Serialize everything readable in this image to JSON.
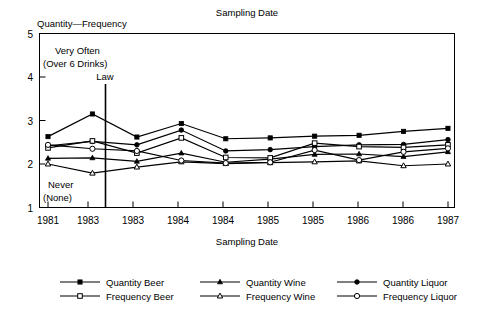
{
  "chart_data": {
    "type": "line",
    "title": "Sampling Date",
    "ylabel": "Quantity—Frequency",
    "xlabel": "Sampling Date",
    "categories": [
      "1981",
      "1983",
      "1983",
      "1984",
      "1984",
      "1985",
      "1985",
      "1986",
      "1986",
      "1987"
    ],
    "ylim": [
      1,
      5
    ],
    "yticks": [
      1,
      2,
      3,
      4,
      5
    ],
    "grid": false,
    "legend_position": "below",
    "annotations": [
      {
        "text": "Very Often",
        "note": "upper-left scale anchor line 1"
      },
      {
        "text": "(Over 6 Drinks)",
        "note": "upper-left scale anchor line 2"
      },
      {
        "text": "Never",
        "note": "lower-left scale anchor line 1"
      },
      {
        "text": "(None)",
        "note": "lower-left scale anchor line 2"
      },
      {
        "text": "Law",
        "note": "vertical reference line between 2nd and 3rd sampling date"
      }
    ],
    "series": [
      {
        "name": "Quantity Beer",
        "marker": "filled-square",
        "values": [
          2.63,
          3.15,
          2.62,
          2.93,
          2.58,
          2.6,
          2.64,
          2.66,
          2.75,
          2.82
        ]
      },
      {
        "name": "Quantity Wine",
        "marker": "filled-triangle",
        "values": [
          2.13,
          2.14,
          2.06,
          2.25,
          2.04,
          2.11,
          2.22,
          2.23,
          2.17,
          2.28
        ]
      },
      {
        "name": "Quantity Liquor",
        "marker": "filled-circle",
        "values": [
          2.42,
          2.52,
          2.44,
          2.78,
          2.3,
          2.33,
          2.4,
          2.44,
          2.45,
          2.56
        ]
      },
      {
        "name": "Frequency Beer",
        "marker": "open-square",
        "values": [
          2.37,
          2.53,
          2.25,
          2.6,
          2.15,
          2.14,
          2.48,
          2.4,
          2.38,
          2.44
        ]
      },
      {
        "name": "Frequency Wine",
        "marker": "open-triangle",
        "values": [
          2.0,
          1.79,
          1.93,
          2.05,
          2.01,
          2.03,
          2.05,
          2.07,
          1.96,
          2.0
        ]
      },
      {
        "name": "Frequency Liquor",
        "marker": "open-circle",
        "values": [
          2.44,
          2.35,
          2.3,
          2.08,
          2.02,
          2.04,
          2.32,
          2.09,
          2.28,
          2.36
        ]
      }
    ]
  },
  "legend": {
    "items": [
      {
        "label": "Quantity Beer",
        "marker": "filled-square"
      },
      {
        "label": "Quantity Wine",
        "marker": "filled-triangle"
      },
      {
        "label": "Quantity Liquor",
        "marker": "filled-circle"
      },
      {
        "label": "Frequency Beer",
        "marker": "open-square"
      },
      {
        "label": "Frequency Wine",
        "marker": "open-triangle"
      },
      {
        "label": "Frequency Liquor",
        "marker": "open-circle"
      }
    ]
  },
  "colors": {
    "ink": "#000000",
    "paper": "#ffffff"
  }
}
